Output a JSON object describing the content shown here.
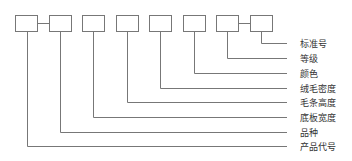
{
  "diagram": {
    "type": "code-structure",
    "line_color": "#777777",
    "box_count": 8,
    "connected_pairs": [
      [
        0,
        1
      ],
      [
        6,
        7
      ]
    ],
    "labels": [
      {
        "index": 7,
        "text": "标准号"
      },
      {
        "index": 6,
        "text": "等级"
      },
      {
        "index": 5,
        "text": "颜色"
      },
      {
        "index": 4,
        "text": "绒毛密度"
      },
      {
        "index": 3,
        "text": "毛条高度"
      },
      {
        "index": 2,
        "text": "底板宽度"
      },
      {
        "index": 1,
        "text": "品种"
      },
      {
        "index": 0,
        "text": "产品代号"
      }
    ]
  }
}
